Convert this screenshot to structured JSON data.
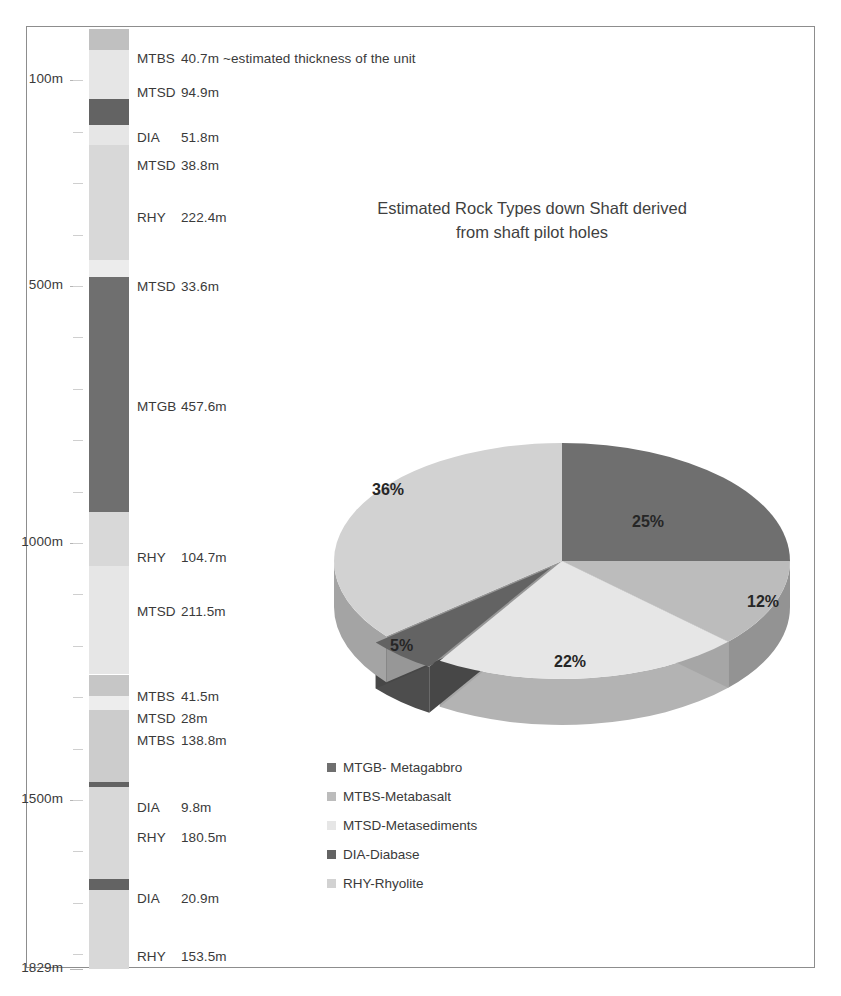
{
  "chart_data": [
    {
      "type": "pie",
      "title": "Estimated Rock Types down Shaft derived from  shaft pilot holes",
      "title_line1": "Estimated Rock Types down Shaft derived",
      "title_line2": "from  shaft pilot holes",
      "categories": [
        "MTGB- Metagabbro",
        "MTBS-Metabasalt",
        "MTSD-Metasediments",
        "DIA-Diabase",
        "RHY-Rhyolite"
      ],
      "values": [
        25,
        12,
        22,
        5,
        36
      ],
      "value_labels": [
        "25%",
        "12%",
        "22%",
        "5%",
        "36%"
      ],
      "colors": [
        "#6f6f6f",
        "#bcbcbc",
        "#e6e6e6",
        "#636363",
        "#d2d2d2"
      ],
      "exploded": [
        "DIA-Diabase"
      ],
      "legend_position": "bottom-left",
      "legend": [
        {
          "label": "MTGB- Metagabbro",
          "color": "#6f6f6f"
        },
        {
          "label": "MTBS-Metabasalt",
          "color": "#bcbcbc"
        },
        {
          "label": "MTSD-Metasediments",
          "color": "#e6e6e6"
        },
        {
          "label": "DIA-Diabase",
          "color": "#636363"
        },
        {
          "label": "RHY-Rhyolite",
          "color": "#d2d2d2"
        }
      ]
    },
    {
      "type": "bar",
      "title": "Stratigraphic column down shaft",
      "ylabel": "Depth",
      "ylim": [
        0,
        1829
      ],
      "axis_ticks": [
        "100m",
        "500m",
        "1000m",
        "1500m",
        "1829m"
      ],
      "axis_tick_values": [
        100,
        500,
        1000,
        1500,
        1829
      ],
      "categories": [
        "MTBS",
        "MTSD",
        "DIA",
        "MTSD",
        "RHY",
        "MTSD",
        "MTGB",
        "RHY",
        "MTSD",
        "MTBS",
        "MTSD",
        "MTBS",
        "DIA",
        "RHY",
        "DIA",
        "RHY"
      ],
      "values": [
        40.7,
        94.9,
        51.8,
        38.8,
        222.4,
        33.6,
        457.6,
        104.7,
        211.5,
        41.5,
        28,
        138.8,
        9.8,
        180.5,
        20.9,
        153.5
      ],
      "units": [
        {
          "code": "MTBS",
          "thickness": "40.7m",
          "note": "~estimated thickness of the unit",
          "color": "#c0c0c0"
        },
        {
          "code": "MTSD",
          "thickness": "94.9m",
          "note": "",
          "color": "#e6e6e6"
        },
        {
          "code": "DIA",
          "thickness": "51.8m",
          "note": "",
          "color": "#636363"
        },
        {
          "code": "MTSD",
          "thickness": "38.8m",
          "note": "",
          "color": "#e6e6e6"
        },
        {
          "code": "RHY",
          "thickness": "222.4m",
          "note": "",
          "color": "#d8d8d8"
        },
        {
          "code": "MTSD",
          "thickness": "33.6m",
          "note": "",
          "color": "#ececec"
        },
        {
          "code": "MTGB",
          "thickness": "457.6m",
          "note": "",
          "color": "#6f6f6f"
        },
        {
          "code": "RHY",
          "thickness": "104.7m",
          "note": "",
          "color": "#d8d8d8"
        },
        {
          "code": "MTSD",
          "thickness": "211.5m",
          "note": "",
          "color": "#e6e6e6"
        },
        {
          "code": "MTBS",
          "thickness": "41.5m",
          "note": "",
          "color": "#c6c6c6"
        },
        {
          "code": "MTSD",
          "thickness": "28m",
          "note": "",
          "color": "#ededed"
        },
        {
          "code": "MTBS",
          "thickness": "138.8m",
          "note": "",
          "color": "#cccccc"
        },
        {
          "code": "DIA",
          "thickness": "9.8m",
          "note": "",
          "color": "#636363"
        },
        {
          "code": "RHY",
          "thickness": "180.5m",
          "note": "",
          "color": "#d8d8d8"
        },
        {
          "code": "DIA",
          "thickness": "20.9m",
          "note": "",
          "color": "#636363"
        },
        {
          "code": "RHY",
          "thickness": "153.5m",
          "note": "",
          "color": "#d8d8d8"
        }
      ]
    }
  ],
  "column": {
    "axis_ticks": [
      {
        "label": "100m",
        "depth": 100
      },
      {
        "label": "500m",
        "depth": 500
      },
      {
        "label": "1000m",
        "depth": 1000
      },
      {
        "label": "1500m",
        "depth": 1500
      },
      {
        "label": "1829m",
        "depth": 1829
      }
    ],
    "units": [
      {
        "code": "MTBS",
        "thickness": "40.7m",
        "note": "~estimated thickness of the unit"
      },
      {
        "code": "MTSD",
        "thickness": "94.9m",
        "note": ""
      },
      {
        "code": "DIA",
        "thickness": "51.8m",
        "note": ""
      },
      {
        "code": "MTSD",
        "thickness": "38.8m",
        "note": ""
      },
      {
        "code": "RHY",
        "thickness": "222.4m",
        "note": ""
      },
      {
        "code": "MTSD",
        "thickness": "33.6m",
        "note": ""
      },
      {
        "code": "MTGB",
        "thickness": "457.6m",
        "note": ""
      },
      {
        "code": "RHY",
        "thickness": "104.7m",
        "note": ""
      },
      {
        "code": "MTSD",
        "thickness": "211.5m",
        "note": ""
      },
      {
        "code": "MTBS",
        "thickness": "41.5m",
        "note": ""
      },
      {
        "code": "MTSD",
        "thickness": "28m",
        "note": ""
      },
      {
        "code": "MTBS",
        "thickness": "138.8m",
        "note": ""
      },
      {
        "code": "DIA",
        "thickness": "9.8m",
        "note": ""
      },
      {
        "code": "RHY",
        "thickness": "180.5m",
        "note": ""
      },
      {
        "code": "DIA",
        "thickness": "20.9m",
        "note": ""
      },
      {
        "code": "RHY",
        "thickness": "153.5m",
        "note": ""
      }
    ]
  },
  "pie": {
    "title_line1": "Estimated Rock Types down Shaft derived",
    "title_line2": "from  shaft pilot holes",
    "slices": [
      {
        "label": "MTGB- Metagabbro",
        "pct": "25%",
        "value": 25,
        "color": "#6f6f6f"
      },
      {
        "label": "MTBS-Metabasalt",
        "pct": "12%",
        "value": 12,
        "color": "#bcbcbc"
      },
      {
        "label": "MTSD-Metasediments",
        "pct": "22%",
        "value": 22,
        "color": "#e6e6e6"
      },
      {
        "label": "DIA-Diabase",
        "pct": "5%",
        "value": 5,
        "color": "#636363"
      },
      {
        "label": "RHY-Rhyolite",
        "pct": "36%",
        "value": 36,
        "color": "#d2d2d2"
      }
    ]
  }
}
